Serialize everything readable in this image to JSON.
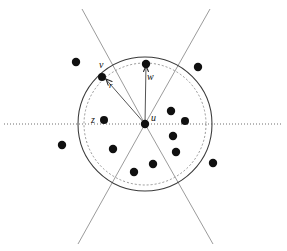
{
  "figure": {
    "background_color": "#ffffff",
    "width": 287,
    "height": 251,
    "stroke_color": "#3a3a3a",
    "dot_color": "#101010",
    "axis_style": "dotted",
    "inner_circle_style": "dashed",
    "outer_circle_style": "solid"
  },
  "labels": {
    "u": "u",
    "v": "v",
    "w": "w",
    "z": "z",
    "r": "r"
  },
  "geometry": {
    "center": {
      "x": 145,
      "y": 124
    },
    "outer_radius": 67,
    "inner_radius": 61,
    "axis_y": 124,
    "axis_x_start": 4,
    "axis_x_end": 283,
    "cone_lines": [
      {
        "name": "cone-upper-left",
        "x1": 82,
        "y1": 9,
        "x2": 145,
        "y2": 124
      },
      {
        "name": "cone-upper-right",
        "x1": 210,
        "y1": 9,
        "x2": 145,
        "y2": 124
      },
      {
        "name": "cone-lower-left",
        "x1": 78,
        "y1": 244,
        "x2": 145,
        "y2": 124
      },
      {
        "name": "cone-lower-right",
        "x1": 213,
        "y1": 244,
        "x2": 145,
        "y2": 124
      }
    ],
    "radius_segments": [
      {
        "name": "segment-u-to-v",
        "x1": 145,
        "y1": 124,
        "x2": 103,
        "y2": 76
      },
      {
        "name": "segment-u-to-w",
        "x1": 145,
        "y1": 124,
        "x2": 146,
        "y2": 64
      }
    ],
    "arrow_r": {
      "tip_x": 106,
      "tip_y": 79,
      "tail_x": 124,
      "tail_y": 98
    },
    "arrow_w": {
      "tip_x": 146,
      "tip_y": 66,
      "tail_x": 146,
      "tail_y": 76
    }
  },
  "points": [
    {
      "name": "point-u-center",
      "x": 145,
      "y": 124,
      "r": 4.2,
      "label": "u",
      "label_dx": 6,
      "label_dy": -11
    },
    {
      "name": "point-v",
      "x": 102,
      "y": 77,
      "r": 4.0,
      "label": "v",
      "label_dx": -3,
      "label_dy": -17
    },
    {
      "name": "point-w",
      "x": 146,
      "y": 64,
      "r": 4.2,
      "label": "w",
      "label_dx": 1,
      "label_dy": 8
    },
    {
      "name": "point-z",
      "x": 104,
      "y": 120,
      "r": 4.0,
      "label": "z",
      "label_dx": -13,
      "label_dy": -5
    },
    {
      "name": "point-inside-1",
      "x": 171,
      "y": 111,
      "r": 4.2,
      "label": "",
      "label_dx": 0,
      "label_dy": 0
    },
    {
      "name": "point-inside-2",
      "x": 185,
      "y": 121,
      "r": 4.0,
      "label": "",
      "label_dx": 0,
      "label_dy": 0
    },
    {
      "name": "point-inside-3",
      "x": 173,
      "y": 136,
      "r": 4.2,
      "label": "",
      "label_dx": 0,
      "label_dy": 0
    },
    {
      "name": "point-inside-4",
      "x": 176,
      "y": 152,
      "r": 4.2,
      "label": "",
      "label_dx": 0,
      "label_dy": 0
    },
    {
      "name": "point-inside-5",
      "x": 153,
      "y": 164,
      "r": 4.2,
      "label": "",
      "label_dx": 0,
      "label_dy": 0
    },
    {
      "name": "point-inside-6",
      "x": 134,
      "y": 172,
      "r": 4.2,
      "label": "",
      "label_dx": 0,
      "label_dy": 0
    },
    {
      "name": "point-inside-7",
      "x": 113,
      "y": 149,
      "r": 4.2,
      "label": "",
      "label_dx": 0,
      "label_dy": 0
    },
    {
      "name": "point-outside-1",
      "x": 76,
      "y": 62,
      "r": 4.2,
      "label": "",
      "label_dx": 0,
      "label_dy": 0
    },
    {
      "name": "point-outside-2",
      "x": 198,
      "y": 67,
      "r": 4.2,
      "label": "",
      "label_dx": 0,
      "label_dy": 0
    },
    {
      "name": "point-outside-3",
      "x": 62,
      "y": 145,
      "r": 4.2,
      "label": "",
      "label_dx": 0,
      "label_dy": 0
    },
    {
      "name": "point-outside-4",
      "x": 213,
      "y": 163,
      "r": 4.2,
      "label": "",
      "label_dx": 0,
      "label_dy": 0
    }
  ]
}
